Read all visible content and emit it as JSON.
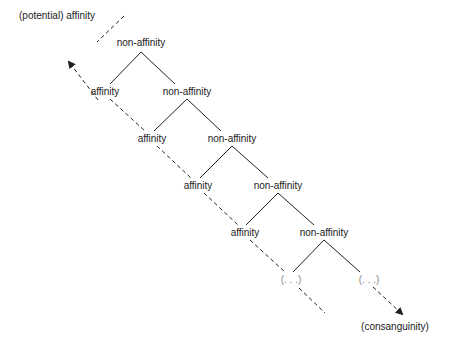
{
  "labels": {
    "top_left": "(potential) affinity",
    "bottom_right": "(consanguinity)"
  },
  "nodes": [
    {
      "id": "n0",
      "text": "non-affinity",
      "x": 141,
      "y": 43
    },
    {
      "id": "a1",
      "text": "affinity",
      "x": 105,
      "y": 92
    },
    {
      "id": "n1",
      "text": "non-affinity",
      "x": 187,
      "y": 92
    },
    {
      "id": "a2",
      "text": "affinity",
      "x": 152,
      "y": 139
    },
    {
      "id": "n2",
      "text": "non-affinity",
      "x": 232,
      "y": 139
    },
    {
      "id": "a3",
      "text": "affinity",
      "x": 198,
      "y": 186
    },
    {
      "id": "n3",
      "text": "non-affinity",
      "x": 278,
      "y": 186
    },
    {
      "id": "a4",
      "text": "affinity",
      "x": 245,
      "y": 233
    },
    {
      "id": "n4",
      "text": "non-affinity",
      "x": 324,
      "y": 233
    },
    {
      "id": "e1",
      "text": "(. . .)",
      "x": 291,
      "y": 280
    },
    {
      "id": "e2",
      "text": "(. . .)",
      "x": 369,
      "y": 280
    }
  ],
  "colors": {
    "line": "#222222",
    "text": "#222222",
    "ellipsis": "#888888"
  }
}
